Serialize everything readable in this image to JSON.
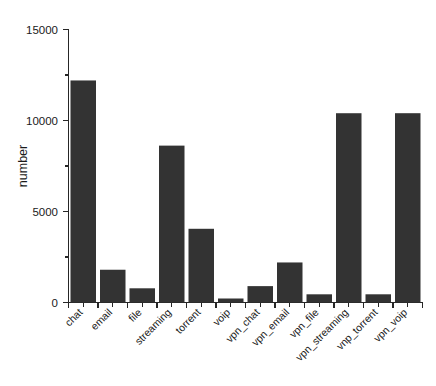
{
  "chart_data": {
    "type": "bar",
    "title": "",
    "subtitle": "",
    "xlabel": "",
    "ylabel": "number",
    "categories": [
      "chat",
      "email",
      "file",
      "streaming",
      "torrent",
      "voip",
      "vpn_chat",
      "vpn_email",
      "vpn_file",
      "vpn_streaming",
      "vnp_torrent",
      "vpn_voip"
    ],
    "values": [
      2380,
      1050,
      12200,
      1800,
      780,
      8620,
      4050,
      220,
      900,
      2200,
      450,
      10400
    ],
    "series": [
      {
        "name": "number",
        "values": [
          2380,
          1050,
          12200,
          1800,
          780,
          8620,
          4050,
          220,
          900,
          2200,
          450,
          10400
        ]
      }
    ],
    "ylim": [
      0,
      15000
    ],
    "ytick_labels": [
      "0",
      "5000",
      "10000",
      "15000"
    ],
    "ytick_values": [
      0,
      5000,
      10000,
      15000
    ],
    "yminor_tick_values": [
      2500,
      7500,
      12500
    ],
    "grid": false,
    "legend": false,
    "legend_position": "none",
    "bar_color": "#333333",
    "axis_color": "#262626",
    "background_color": "#ffffff",
    "xtick_label_rotation": 45
  }
}
